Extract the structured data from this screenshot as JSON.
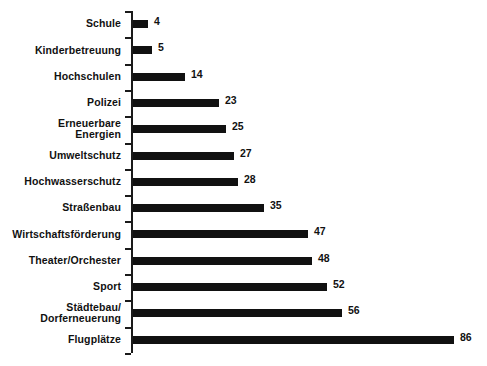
{
  "chart_data": {
    "type": "bar",
    "orientation": "horizontal",
    "title": "",
    "subtitle": "",
    "xlabel": "",
    "ylabel": "",
    "grid": false,
    "legend": false,
    "legend_position": "none",
    "xlim": [
      0,
      86
    ],
    "bar_color": "#111111",
    "axis_color": "#1a1a1a",
    "background_color": "#ffffff",
    "value_label_position": "outside-right",
    "categories": [
      "Schule",
      "Kinderbetreuung",
      "Hochschulen",
      "Polizei",
      "Erneuerbare\nEnergien",
      "Umweltschutz",
      "Hochwasserschutz",
      "Straßenbau",
      "Wirtschaftsförderung",
      "Theater/Orchester",
      "Sport",
      "Städtebau/\nDorferneuerung",
      "Flugplätze"
    ],
    "values": [
      4,
      5,
      14,
      23,
      25,
      27,
      28,
      35,
      47,
      48,
      52,
      56,
      86
    ],
    "value_labels": [
      "4",
      "5",
      "14",
      "23",
      "25",
      "27",
      "28",
      "35",
      "47",
      "48",
      "52",
      "56",
      "86"
    ]
  }
}
